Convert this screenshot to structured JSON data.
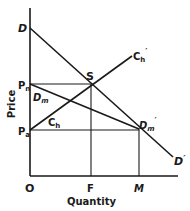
{
  "diagram": {
    "type": "economics-supply-demand",
    "axes": {
      "y_label": "Price",
      "x_label": "Quantity",
      "origin_label": "O"
    },
    "price_levels": [
      {
        "label": "P",
        "sub": "n"
      },
      {
        "label": "P",
        "sub": "a"
      }
    ],
    "quantity_levels": [
      {
        "label": "F"
      },
      {
        "label": "M"
      }
    ],
    "curves": [
      {
        "name": "total-demand",
        "start_label": "D",
        "end_label": "D",
        "end_prime": "′"
      },
      {
        "name": "import-demand",
        "start_label": "D",
        "start_sub": "m",
        "end_label": "D",
        "end_sub": "m",
        "end_prime": "′"
      },
      {
        "name": "home-supply",
        "start_label": "C",
        "start_sub": "h",
        "end_label": "C",
        "end_sub": "h",
        "end_prime": "′"
      }
    ],
    "points": [
      {
        "label": "S"
      }
    ]
  }
}
